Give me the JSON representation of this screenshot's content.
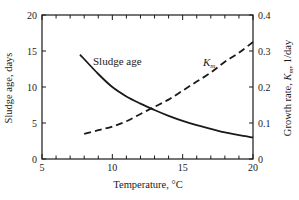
{
  "chart_data": {
    "type": "line",
    "title": "",
    "xlabel": "Temperature, °C",
    "ylabel": "Sludge age, days",
    "ylabel_right": "Growth rate, K_m, 1/day",
    "xlim": [
      5,
      20
    ],
    "ylim": [
      0,
      20
    ],
    "ylim_right": [
      0,
      0.4
    ],
    "x_ticks": [
      "5",
      "10",
      "15",
      "20"
    ],
    "y_ticks": [
      "0",
      "5",
      "10",
      "15",
      "20"
    ],
    "y_ticks_right": [
      "0",
      "0.1",
      "0.2",
      "0.3",
      "0.4"
    ],
    "grid": false,
    "legend": "inline annotations",
    "series": [
      {
        "name": "Sludge age",
        "axis": "left",
        "style": "solid",
        "x": [
          7.7,
          9,
          10,
          11,
          12,
          13,
          14,
          15,
          16,
          17,
          18,
          19,
          20
        ],
        "values": [
          14.5,
          11.8,
          10.0,
          8.7,
          7.7,
          6.8,
          6.0,
          5.3,
          4.7,
          4.2,
          3.7,
          3.3,
          3.0
        ]
      },
      {
        "name": "K_m",
        "axis": "right",
        "style": "dashed",
        "x": [
          8,
          9,
          10,
          11,
          12,
          13,
          14,
          15,
          16,
          17,
          18,
          19,
          20
        ],
        "values": [
          0.07,
          0.08,
          0.09,
          0.105,
          0.125,
          0.145,
          0.165,
          0.19,
          0.215,
          0.24,
          0.27,
          0.295,
          0.325
        ]
      }
    ],
    "annotations": [
      {
        "text": "Sludge age",
        "x": 9.6,
        "y": 13.5
      },
      {
        "text": "K",
        "subscript": "m",
        "x": 16.4,
        "y": 0.245
      }
    ]
  },
  "labels": {
    "sludge_annot": "Sludge age",
    "km_annot_main": "K",
    "km_annot_sub": "m",
    "xlabel": "Temperature, °C",
    "ylabel_left": "Sludge age, days",
    "ylabel_right_pre": "Growth rate, ",
    "ylabel_right_k": "K",
    "ylabel_right_sub": "m",
    "ylabel_right_post": ", 1/day"
  }
}
